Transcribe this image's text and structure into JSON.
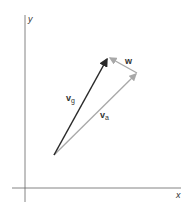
{
  "axes": {
    "x_label": "x",
    "y_label": "y"
  },
  "vectors": {
    "vg": {
      "label_main": "v",
      "label_sub": "g",
      "color": "#2a2a2a"
    },
    "va": {
      "label_main": "v",
      "label_sub": "a",
      "color": "#a8a8a8"
    },
    "w": {
      "label_main": "w",
      "color": "#a8a8a8"
    }
  }
}
